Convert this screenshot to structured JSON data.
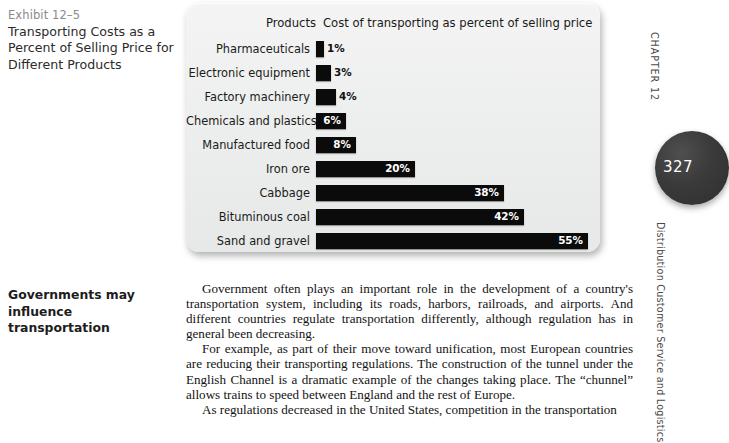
{
  "exhibit": {
    "number": "Exhibit 12–5",
    "title": "Transporting Costs as a Percent of Selling Price for Different Products"
  },
  "margin_note": "Governments may influence transportation",
  "chart_data": {
    "type": "bar",
    "orientation": "horizontal",
    "title": "Transporting Costs as a Percent of Selling Price for Different Products",
    "xlabel": "Cost of transporting as percent of selling price",
    "ylabel": "Products",
    "header_products": "Products",
    "header_cost": "Cost of transporting as percent of selling price",
    "categories": [
      "Pharmaceuticals",
      "Electronic equipment",
      "Factory machinery",
      "Chemicals and plastics",
      "Manufactured food",
      "Iron ore",
      "Cabbage",
      "Bituminous coal",
      "Sand and gravel"
    ],
    "values": [
      1,
      3,
      4,
      6,
      8,
      20,
      38,
      42,
      55
    ],
    "value_labels": [
      "1%",
      "3%",
      "4%",
      "6%",
      "8%",
      "20%",
      "38%",
      "42%",
      "55%"
    ],
    "bar_color": "#0b0b0b",
    "xlim": [
      0,
      55
    ],
    "grid": false,
    "legend": "none"
  },
  "body": {
    "paragraphs": [
      "Government often plays an important role in the development of a country's transportation system, including its roads, harbors, railroads, and airports. And different countries regulate transportation differently, although regulation has in general been decreasing.",
      "For example, as part of their move toward unification, most European countries are reducing their transporting regulations. The construction of the tunnel under the English Channel is a dramatic example of the changes taking place. The “chunnel” allows trains to speed between England and the rest of Europe.",
      "As regulations decreased in the United States, competition in the transportation"
    ]
  },
  "running_head": {
    "chapter": "CHAPTER 12",
    "section": "Distribution Customer Service and Logistics",
    "page_number": "327"
  }
}
